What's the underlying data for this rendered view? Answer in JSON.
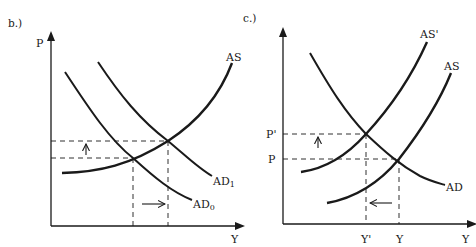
{
  "figure": {
    "panels": [
      {
        "id": "b",
        "title": "b.)",
        "y_axis_label": "P",
        "x_axis_label": "Y",
        "curves": [
          {
            "name": "AS",
            "label": "AS",
            "subscript": ""
          },
          {
            "name": "AD1",
            "label": "AD",
            "subscript": "1"
          },
          {
            "name": "AD0",
            "label": "AD",
            "subscript": "0"
          }
        ],
        "annotations": {
          "price_shift": "up",
          "output_shift": "right"
        }
      },
      {
        "id": "c",
        "title": "c.)",
        "y_axis_label": "",
        "x_axis_label": "Y",
        "price_ticks": [
          "P'",
          "P"
        ],
        "output_ticks": [
          "Y'",
          "Y"
        ],
        "curves": [
          {
            "name": "AS_prime",
            "label": "AS'"
          },
          {
            "name": "AS",
            "label": "AS"
          },
          {
            "name": "AD",
            "label": "AD"
          }
        ],
        "annotations": {
          "price_shift": "up",
          "output_shift": "left"
        }
      }
    ],
    "colors": {
      "line": "#1a1a1a",
      "background": "#ffffff"
    }
  }
}
